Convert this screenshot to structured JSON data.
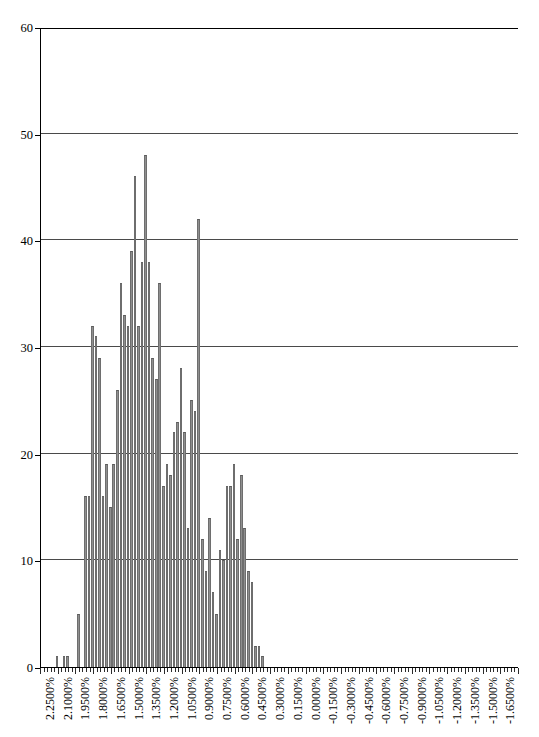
{
  "chart_data": {
    "type": "bar",
    "title": "",
    "subtitle": "",
    "xlabel": "",
    "ylabel": "",
    "grid": true,
    "legend": null,
    "ylim": [
      0,
      60
    ],
    "y_ticks": [
      0,
      10,
      20,
      30,
      40,
      50,
      60
    ],
    "y_tick_labels": [
      "0",
      "10",
      "20",
      "30",
      "40",
      "50",
      "60"
    ],
    "x_tick_labels": [
      "2.2500%",
      "2.1000%",
      "1.9500%",
      "1.8000%",
      "1.6500%",
      "1.5000%",
      "1.3500%",
      "1.2000%",
      "1.0500%",
      "0.9000%",
      "0.7500%",
      "0.6000%",
      "0.4500%",
      "0.3000%",
      "0.1500%",
      "0.0000%",
      "-0.1500%",
      "-0.3000%",
      "-0.4500%",
      "-0.6000%",
      "-0.7500%",
      "-0.9000%",
      "-1.0500%",
      "-1.2000%",
      "-1.3500%",
      "-1.5000%",
      "-1.6500%"
    ],
    "x_tick_interval_bins": 5,
    "bin_width_percent": 0.03,
    "x_start_percent": 2.25,
    "x_direction": "descending",
    "bar_color": "#8f8f8f",
    "bar_edge_color": "#6e6e6e",
    "axis_color": "#000000",
    "grid_color": "#4a4a4a",
    "n_bins": 135,
    "values": [
      0,
      0,
      0,
      0,
      1,
      0,
      1,
      1,
      0,
      0,
      5,
      0,
      16,
      16,
      32,
      31,
      29,
      16,
      19,
      15,
      19,
      26,
      36,
      33,
      32,
      39,
      46,
      32,
      38,
      48,
      38,
      29,
      27,
      36,
      17,
      19,
      18,
      22,
      23,
      28,
      22,
      13,
      25,
      24,
      42,
      12,
      9,
      14,
      7,
      5,
      11,
      10,
      17,
      17,
      19,
      12,
      18,
      13,
      9,
      8,
      2,
      2,
      1,
      0,
      0,
      0,
      0,
      0,
      0,
      0,
      0,
      0,
      0,
      0,
      0,
      0,
      0,
      0,
      0,
      0,
      0,
      0,
      0,
      0,
      0,
      0,
      0,
      0,
      0,
      0,
      0,
      0,
      0,
      0,
      0,
      0,
      0,
      0,
      0,
      0,
      0,
      0,
      0,
      0,
      0,
      0,
      0,
      0,
      0,
      0,
      0,
      0,
      0,
      0,
      0,
      0,
      0,
      0,
      0,
      0,
      0,
      0,
      0,
      0,
      0,
      0,
      0,
      0,
      0,
      0,
      0,
      0,
      0,
      0,
      0
    ]
  }
}
